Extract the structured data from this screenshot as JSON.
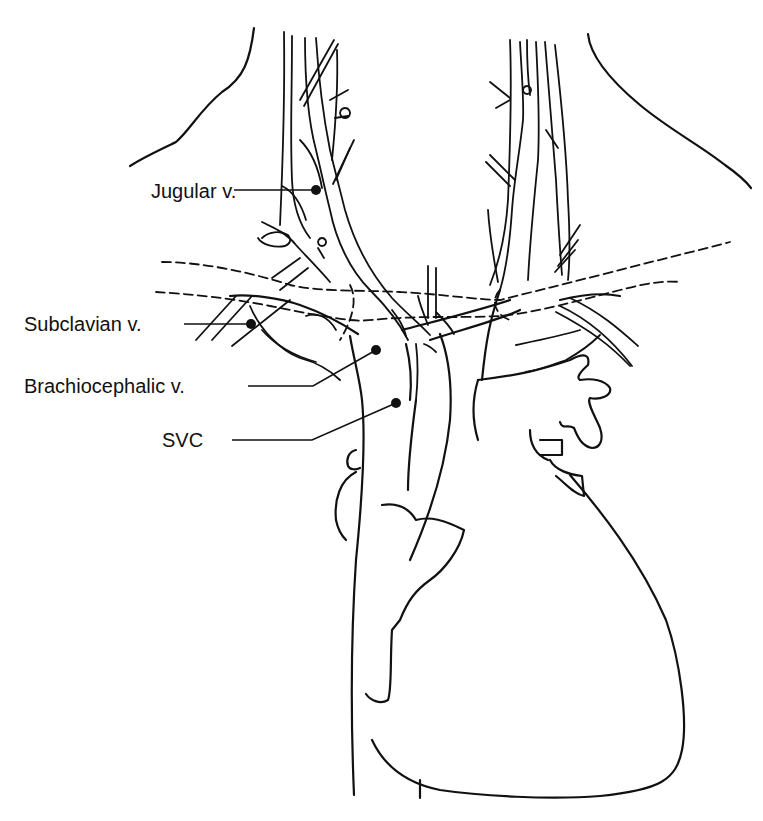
{
  "figure": {
    "style": "black line drawing on white background",
    "colors": {
      "ink": "#111111",
      "background": "#ffffff"
    }
  },
  "labels": [
    {
      "id": "jugular",
      "text": "Jugular v.",
      "x": 151,
      "y": 181
    },
    {
      "id": "subclavian",
      "text": "Subclavian v.",
      "x": 24,
      "y": 315
    },
    {
      "id": "brachiocephalic",
      "text": "Brachiocephalic v.",
      "x": 24,
      "y": 378
    },
    {
      "id": "svc",
      "text": "SVC",
      "x": 162,
      "y": 424
    }
  ],
  "leaders": [
    {
      "label": "jugular",
      "from": [
        275,
        190
      ],
      "to": [
        316,
        190
      ]
    },
    {
      "label": "subclavian",
      "from": [
        184,
        323
      ],
      "to": [
        251,
        323
      ]
    },
    {
      "label": "brachiocephalic",
      "from": [
        248,
        386
      ],
      "to": [
        313,
        386
      ],
      "to2": [
        376,
        350
      ]
    },
    {
      "label": "svc",
      "from": [
        232,
        440
      ],
      "to": [
        312,
        440
      ],
      "to2": [
        396,
        403
      ]
    }
  ]
}
